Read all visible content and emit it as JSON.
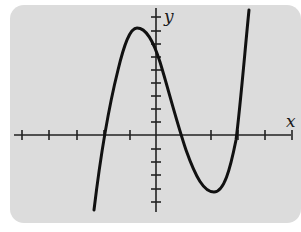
{
  "figure": {
    "type": "cubic function graph",
    "axes": {
      "x_label": "x",
      "y_label": "y",
      "x_ticks_left": 5,
      "x_ticks_right": 5,
      "y_ticks_up": 9,
      "y_ticks_down": 6
    },
    "curve": {
      "shape": "cubic, positive leading coefficient",
      "local_max": "left of y-axis, above x-axis",
      "local_min": "right of y-axis, below x-axis",
      "x_intercepts": 3,
      "y_intercept": "positive"
    },
    "colors": {
      "background": "#dcdcdc",
      "stroke": "#111111"
    }
  }
}
